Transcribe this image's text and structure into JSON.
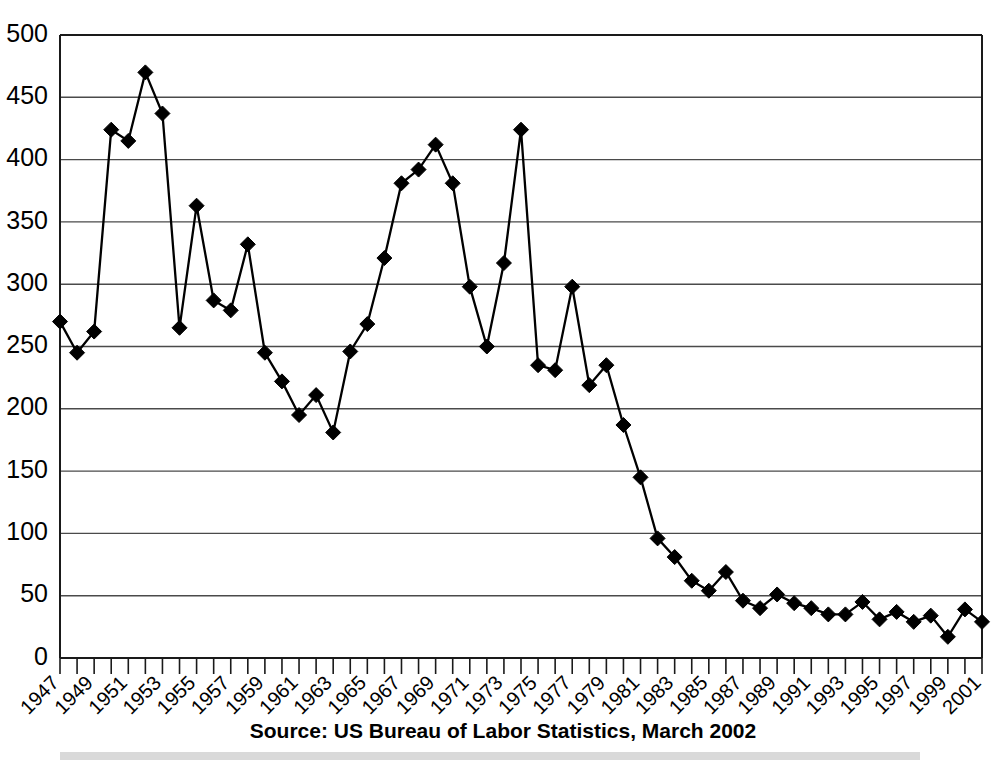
{
  "chart_data": {
    "type": "line",
    "title": "",
    "subtitle": "",
    "xlabel": "",
    "ylabel": "",
    "source_note": "Source: US Bureau of Labor Statistics, March 2002",
    "grid": true,
    "legend": "none",
    "marker": "diamond",
    "xlim": [
      1947,
      2001
    ],
    "ylim": [
      0,
      500
    ],
    "ytick_step": 50,
    "xtick_label_step": 2,
    "ytick_labels": [
      "500",
      "450",
      "400",
      "350",
      "300",
      "250",
      "200",
      "150",
      "100",
      "50",
      "0"
    ],
    "ytick_values": [
      500,
      450,
      400,
      350,
      300,
      250,
      200,
      150,
      100,
      50,
      0
    ],
    "xtick_labels": [
      "1947",
      "1949",
      "1951",
      "1953",
      "1955",
      "1957",
      "1959",
      "1961",
      "1963",
      "1965",
      "1967",
      "1969",
      "1971",
      "1973",
      "1975",
      "1977",
      "1979",
      "1981",
      "1983",
      "1985",
      "1987",
      "1989",
      "1991",
      "1993",
      "1995",
      "1997",
      "1999",
      "2001"
    ],
    "x": [
      1947,
      1948,
      1949,
      1950,
      1951,
      1952,
      1953,
      1954,
      1955,
      1956,
      1957,
      1958,
      1959,
      1960,
      1961,
      1962,
      1963,
      1964,
      1965,
      1966,
      1967,
      1968,
      1969,
      1970,
      1971,
      1972,
      1973,
      1974,
      1975,
      1976,
      1977,
      1978,
      1979,
      1980,
      1981,
      1982,
      1983,
      1984,
      1985,
      1986,
      1987,
      1988,
      1989,
      1990,
      1991,
      1992,
      1993,
      1994,
      1995,
      1996,
      1997,
      1998,
      1999,
      2000,
      2001
    ],
    "values": [
      270,
      245,
      262,
      424,
      415,
      470,
      437,
      265,
      363,
      287,
      279,
      332,
      245,
      222,
      195,
      211,
      181,
      246,
      268,
      321,
      381,
      392,
      412,
      381,
      298,
      250,
      317,
      424,
      235,
      231,
      298,
      219,
      235,
      187,
      145,
      96,
      81,
      62,
      54,
      69,
      46,
      40,
      51,
      44,
      40,
      35,
      35,
      45,
      31,
      37,
      29,
      34,
      17,
      39,
      29
    ],
    "colors": {
      "line": "#000000",
      "marker": "#000000",
      "grid": "#4a4a4a",
      "axis": "#1a1a1a",
      "background": "#ffffff"
    }
  }
}
